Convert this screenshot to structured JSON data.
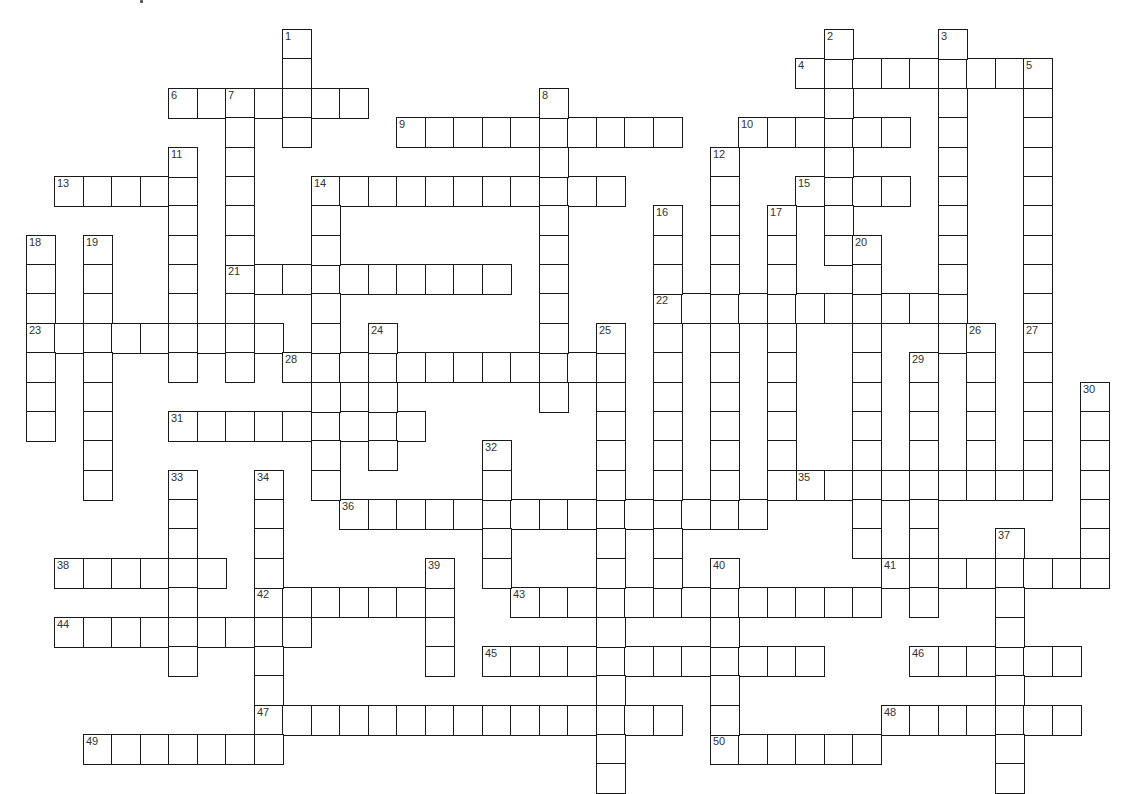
{
  "puzzle": {
    "type": "crossword",
    "grid": {
      "origin_x": 25.5,
      "origin_y": 29,
      "cell_w": 28.5,
      "cell_h": 29.375,
      "cols": 38,
      "rows": 26
    },
    "colors": {
      "line": "#1a1a1a",
      "cell": "#ffffff",
      "number": "#333333",
      "background": "#ffffff"
    },
    "across": [
      {
        "num": "4",
        "col": 27,
        "row": 1,
        "len": 9
      },
      {
        "num": "6",
        "col": 5,
        "row": 2,
        "len": 7
      },
      {
        "num": "9",
        "col": 13,
        "row": 3,
        "len": 10
      },
      {
        "num": "10",
        "col": 25,
        "row": 3,
        "len": 6
      },
      {
        "num": "13",
        "col": 1,
        "row": 5,
        "len": 5
      },
      {
        "num": "14",
        "col": 10,
        "row": 5,
        "len": 11
      },
      {
        "num": "15",
        "col": 27,
        "row": 5,
        "len": 4
      },
      {
        "num": "21",
        "col": 7,
        "row": 8,
        "len": 10
      },
      {
        "num": "22",
        "col": 22,
        "row": 9,
        "len": 11
      },
      {
        "num": "23",
        "col": 0,
        "row": 10,
        "len": 9
      },
      {
        "num": "28",
        "col": 9,
        "row": 11,
        "len": 12
      },
      {
        "num": "31",
        "col": 5,
        "row": 13,
        "len": 9
      },
      {
        "num": "35",
        "col": 27,
        "row": 15,
        "len": 9
      },
      {
        "num": "36",
        "col": 11,
        "row": 16,
        "len": 15
      },
      {
        "num": "38",
        "col": 1,
        "row": 18,
        "len": 6
      },
      {
        "num": "41",
        "col": 30,
        "row": 18,
        "len": 8
      },
      {
        "num": "42",
        "col": 8,
        "row": 19,
        "len": 7
      },
      {
        "num": "43",
        "col": 17,
        "row": 19,
        "len": 13
      },
      {
        "num": "44",
        "col": 1,
        "row": 20,
        "len": 9
      },
      {
        "num": "45",
        "col": 16,
        "row": 21,
        "len": 12
      },
      {
        "num": "46",
        "col": 31,
        "row": 21,
        "len": 6
      },
      {
        "num": "47",
        "col": 8,
        "row": 23,
        "len": 15
      },
      {
        "num": "48",
        "col": 30,
        "row": 23,
        "len": 7
      },
      {
        "num": "49",
        "col": 2,
        "row": 24,
        "len": 7
      },
      {
        "num": "50",
        "col": 24,
        "row": 24,
        "len": 6
      }
    ],
    "down": [
      {
        "num": "1",
        "col": 9,
        "row": 0,
        "len": 4
      },
      {
        "num": "2",
        "col": 28,
        "row": 0,
        "len": 8
      },
      {
        "num": "3",
        "col": 32,
        "row": 0,
        "len": 11
      },
      {
        "num": "5",
        "col": 35,
        "row": 1,
        "len": 9
      },
      {
        "num": "7",
        "col": 7,
        "row": 2,
        "len": 10
      },
      {
        "num": "8",
        "col": 18,
        "row": 2,
        "len": 11
      },
      {
        "num": "11",
        "col": 5,
        "row": 4,
        "len": 8
      },
      {
        "num": "12",
        "col": 24,
        "row": 4,
        "len": 12
      },
      {
        "num": "14",
        "col": 10,
        "row": 5,
        "len": 11
      },
      {
        "num": "16",
        "col": 22,
        "row": 6,
        "len": 13
      },
      {
        "num": "17",
        "col": 26,
        "row": 6,
        "len": 10
      },
      {
        "num": "18",
        "col": 0,
        "row": 7,
        "len": 7
      },
      {
        "num": "19",
        "col": 2,
        "row": 7,
        "len": 9
      },
      {
        "num": "20",
        "col": 29,
        "row": 7,
        "len": 11
      },
      {
        "num": "24",
        "col": 12,
        "row": 10,
        "len": 5
      },
      {
        "num": "25",
        "col": 20,
        "row": 10,
        "len": 16
      },
      {
        "num": "26",
        "col": 33,
        "row": 10,
        "len": 6
      },
      {
        "num": "27",
        "col": 35,
        "row": 10,
        "len": 6
      },
      {
        "num": "29",
        "col": 31,
        "row": 11,
        "len": 9
      },
      {
        "num": "30",
        "col": 37,
        "row": 12,
        "len": 7
      },
      {
        "num": "32",
        "col": 16,
        "row": 14,
        "len": 5
      },
      {
        "num": "33",
        "col": 5,
        "row": 15,
        "len": 7
      },
      {
        "num": "34",
        "col": 8,
        "row": 15,
        "len": 10
      },
      {
        "num": "37",
        "col": 34,
        "row": 17,
        "len": 9
      },
      {
        "num": "39",
        "col": 14,
        "row": 18,
        "len": 4
      },
      {
        "num": "40",
        "col": 24,
        "row": 18,
        "len": 7
      }
    ]
  }
}
